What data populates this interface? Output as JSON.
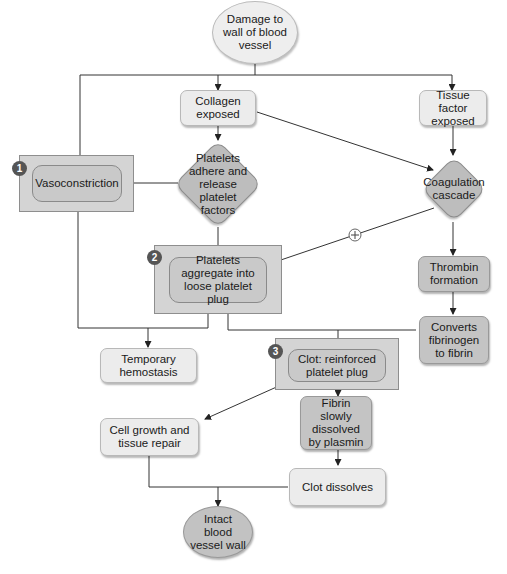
{
  "diagram": {
    "type": "flowchart",
    "colors": {
      "background": "#ffffff",
      "light_box": "#ececec",
      "mid_box": "#dcdcdc",
      "dark_box": "#c4c4c4",
      "frame": "#d4d4d4",
      "badge": "#555555",
      "line": "#333333"
    },
    "nodes": {
      "damage": "Damage to wall of blood vessel",
      "collagen": "Collagen exposed",
      "tissue_factor": "Tissue factor exposed",
      "vasoconstriction": "Vasoconstriction",
      "platelets_adhere": "Platelets adhere and release platelet factors",
      "coagulation": "Coagulation cascade",
      "platelets_aggregate": "Platelets aggregate into loose platelet plug",
      "thrombin": "Thrombin formation",
      "converts": "Converts fibrinogen to fibrin",
      "temporary": "Temporary hemostasis",
      "clot": "Clot: reinforced platelet plug",
      "cell_growth": "Cell growth and tissue repair",
      "fibrin_dissolved": "Fibrin slowly dissolved by plasmin",
      "clot_dissolves": "Clot dissolves",
      "intact": "Intact blood vessel wall"
    },
    "badges": {
      "step1": "1",
      "step2": "2",
      "step3": "3"
    },
    "edges": [
      {
        "from": "damage",
        "to": "vasoconstriction"
      },
      {
        "from": "damage",
        "to": "collagen"
      },
      {
        "from": "damage",
        "to": "tissue_factor"
      },
      {
        "from": "collagen",
        "to": "platelets_adhere"
      },
      {
        "from": "collagen",
        "to": "coagulation"
      },
      {
        "from": "tissue_factor",
        "to": "coagulation"
      },
      {
        "from": "platelets_adhere",
        "to": "vasoconstriction"
      },
      {
        "from": "platelets_adhere",
        "to": "platelets_aggregate"
      },
      {
        "from": "coagulation",
        "to": "platelets_aggregate",
        "label": "positive feedback (+)"
      },
      {
        "from": "coagulation",
        "to": "thrombin"
      },
      {
        "from": "thrombin",
        "to": "converts"
      },
      {
        "from": "vasoconstriction",
        "to": "temporary"
      },
      {
        "from": "platelets_aggregate",
        "to": "temporary"
      },
      {
        "from": "platelets_aggregate",
        "to": "clot"
      },
      {
        "from": "converts",
        "to": "clot"
      },
      {
        "from": "clot",
        "to": "cell_growth"
      },
      {
        "from": "clot",
        "to": "fibrin_dissolved"
      },
      {
        "from": "fibrin_dissolved",
        "to": "clot_dissolves"
      },
      {
        "from": "cell_growth",
        "to": "intact"
      },
      {
        "from": "clot_dissolves",
        "to": "intact"
      }
    ],
    "feedback_symbol": "+"
  }
}
